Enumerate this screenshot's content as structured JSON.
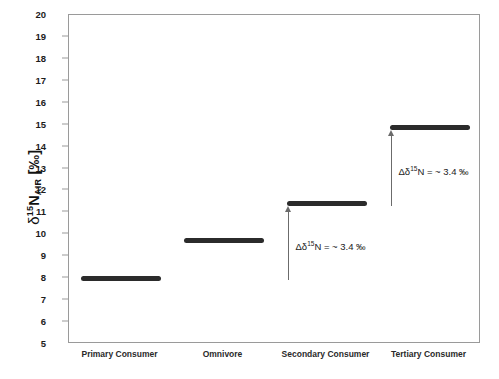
{
  "chart_data": {
    "type": "bar",
    "title": "",
    "subtitle": "",
    "xlabel": "",
    "ylabel": "δ¹⁵N_AIR [‰]",
    "ylabel_parts": {
      "delta": "δ",
      "superscript": "15",
      "element": "N",
      "subscript": "AIR",
      "units": "[‰]"
    },
    "categories": [
      "Primary Consumer",
      "Omnivore",
      "Secondary Consumer",
      "Tertiary Consumer"
    ],
    "values": [
      8.0,
      9.7,
      11.4,
      14.85
    ],
    "ylim": [
      5,
      20
    ],
    "ytick_step": 1,
    "yticks": [
      20,
      19,
      18,
      17,
      16,
      15,
      14,
      13,
      12,
      11,
      10,
      9,
      8,
      7,
      6,
      5
    ],
    "grid": false,
    "legend": "none",
    "bar_color": "#2b2b2b",
    "frame_color": "#9a9a9a",
    "background_color": "#ffffff",
    "annotations": [
      {
        "name": "trophic-shift-1",
        "text": "Δδ¹⁵N = ~ 3.4 ‰",
        "text_parts": {
          "prefix": "Δδ",
          "superscript": "15",
          "suffix": "N = ~ 3.4 ‰"
        },
        "from_value": 8.0,
        "to_value": 11.4,
        "delta": 3.4,
        "arrow_color": "#6b6b6b"
      },
      {
        "name": "trophic-shift-2",
        "text": "Δδ¹⁵N = ~ 3.4 ‰",
        "text_parts": {
          "prefix": "Δδ",
          "superscript": "15",
          "suffix": "N = ~ 3.4 ‰"
        },
        "from_value": 11.4,
        "to_value": 14.85,
        "delta": 3.4,
        "arrow_color": "#6b6b6b"
      }
    ]
  }
}
